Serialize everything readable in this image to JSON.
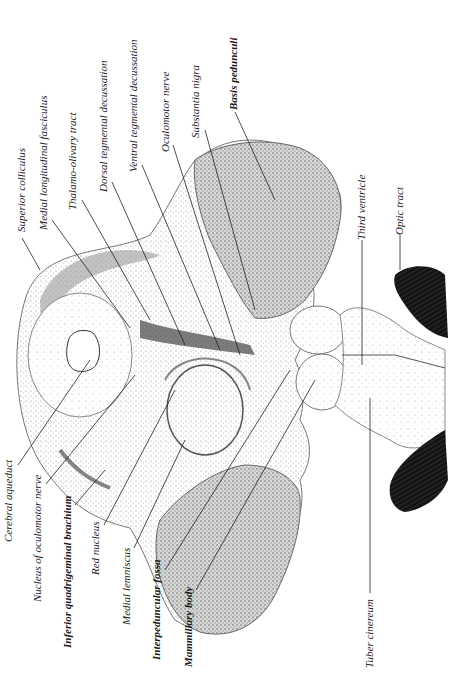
{
  "figure": {
    "orientation": "rotated 90 degrees counter-clockwise",
    "colors": {
      "ink": "#1a1a1a",
      "stipple": "#9a9a9a",
      "shade": "#6e6e6e",
      "optic_tract": "#111111",
      "background": "#ffffff"
    }
  },
  "labels": {
    "top": [
      {
        "id": "superior-colliculus",
        "text": "Superior colliculus"
      },
      {
        "id": "medial-longitudinal-fasciculus",
        "text": "Medial longitudinal fasciculus"
      },
      {
        "id": "thalamo-olivary-tract",
        "text": "Thalamo-olivary tract"
      },
      {
        "id": "dorsal-tegmental-decussation",
        "text": "Dorsal tegmental decussation"
      },
      {
        "id": "ventral-tegmental-decussation",
        "text": "Ventral tegmental decussation"
      },
      {
        "id": "oculomotor-nerve",
        "text": "Oculomotor nerve"
      },
      {
        "id": "substantia-nigra",
        "text": "Substantia nigra"
      },
      {
        "id": "basis-pedunculi",
        "text": "Basis pedunculi"
      }
    ],
    "bottom": [
      {
        "id": "cerebral-aqueduct",
        "text": "Cerebral aqueduct"
      },
      {
        "id": "nucleus-of-oculomotor-nerve",
        "text": "Nucleus of oculomotor nerve"
      },
      {
        "id": "inferior-quadrigeminal-brachium",
        "text": "Inferior quadrigeminal brachium"
      },
      {
        "id": "red-nucleus",
        "text": "Red nucleus"
      },
      {
        "id": "medial-lemniscus",
        "text": "Medial lemniscus"
      },
      {
        "id": "interpeduncular-fossa",
        "text": "Interpeduncular fossa"
      },
      {
        "id": "mammillary-body",
        "text": "Mammillary body"
      }
    ],
    "right": [
      {
        "id": "third-ventricle",
        "text": "Third ventricle"
      },
      {
        "id": "optic-tract",
        "text": "Optic tract"
      },
      {
        "id": "tuber-cinereum",
        "text": "Tuber cinereum"
      }
    ]
  }
}
